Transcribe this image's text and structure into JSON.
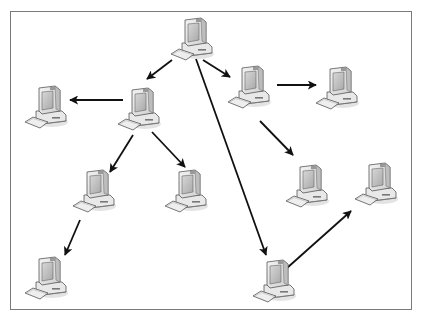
{
  "diagram": {
    "title": "",
    "node_icon": "desktop-computer-icon",
    "colors": {
      "line": "#111111",
      "frame": "#7a7a7a",
      "monitor": "#e6e6e6",
      "screen": "#bdbdbd",
      "shadow": "#cfcfcf"
    },
    "nodes": [
      {
        "id": "n1",
        "label": "computer-top"
      },
      {
        "id": "n2",
        "label": "computer-left-far"
      },
      {
        "id": "n3",
        "label": "computer-hub-left"
      },
      {
        "id": "n4",
        "label": "computer-hub-right"
      },
      {
        "id": "n5",
        "label": "computer-right-top"
      },
      {
        "id": "n6",
        "label": "computer-left-mid"
      },
      {
        "id": "n7",
        "label": "computer-center-mid"
      },
      {
        "id": "n8",
        "label": "computer-right-mid"
      },
      {
        "id": "n9",
        "label": "computer-far-right-mid"
      },
      {
        "id": "n10",
        "label": "computer-bottom-left"
      },
      {
        "id": "n11",
        "label": "computer-bottom-center"
      }
    ],
    "edges": [
      {
        "from": "n1",
        "to": "n3"
      },
      {
        "from": "n1",
        "to": "n4"
      },
      {
        "from": "n1",
        "to": "n11"
      },
      {
        "from": "n3",
        "to": "n2"
      },
      {
        "from": "n3",
        "to": "n6"
      },
      {
        "from": "n3",
        "to": "n7"
      },
      {
        "from": "n4",
        "to": "n5"
      },
      {
        "from": "n4",
        "to": "n8"
      },
      {
        "from": "n6",
        "to": "n10"
      },
      {
        "from": "n11",
        "to": "n9"
      }
    ]
  }
}
